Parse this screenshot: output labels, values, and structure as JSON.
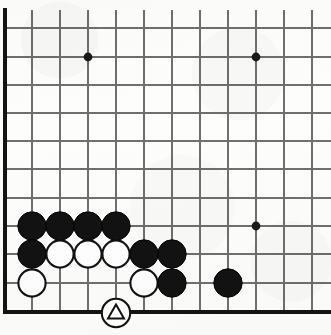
{
  "diagram": {
    "kind": "go-board",
    "board_size": 19,
    "view": {
      "width": 331,
      "height": 335,
      "cell_size": 28,
      "origin_x": 4,
      "origin_y": 0,
      "cropped_edges": [
        "top",
        "right"
      ],
      "visible_columns": 12,
      "visible_rows": 12
    },
    "colors": {
      "background": "#fdfdfc",
      "grid_line": "#6f6f70",
      "border_line": "#141414",
      "black_stone": "#121212",
      "white_stone": "#ffffff",
      "stone_outline": "#111111",
      "star_point": "#1a1a1a",
      "mark": "#111111"
    },
    "geometry": {
      "left_edge_x": 4,
      "bottom_edge_y": 312,
      "vertical_lines_x": [
        4,
        32,
        60,
        88,
        116,
        144,
        172,
        200,
        228,
        256,
        284,
        312
      ],
      "horizontal_lines_y": [
        28,
        57,
        85,
        113,
        141,
        169,
        198,
        226,
        254,
        283,
        312
      ],
      "top_tick_y": 10,
      "stone_radius": 14.2,
      "star_radius": 4.4
    },
    "star_points": [
      {
        "name": "star-point-upper-left",
        "x": 88,
        "y": 57
      },
      {
        "name": "star-point-upper-right",
        "x": 256,
        "y": 57
      },
      {
        "name": "star-point-lower-right",
        "x": 256,
        "y": 226
      }
    ],
    "stones": [
      {
        "id": "b1",
        "color": "black",
        "x": 32,
        "y": 226
      },
      {
        "id": "b2",
        "color": "black",
        "x": 60,
        "y": 226
      },
      {
        "id": "b3",
        "color": "black",
        "x": 88,
        "y": 226
      },
      {
        "id": "b4",
        "color": "black",
        "x": 116,
        "y": 226
      },
      {
        "id": "b5",
        "color": "black",
        "x": 32,
        "y": 254
      },
      {
        "id": "w1",
        "color": "white",
        "x": 60,
        "y": 254
      },
      {
        "id": "w2",
        "color": "white",
        "x": 88,
        "y": 254
      },
      {
        "id": "w3",
        "color": "white",
        "x": 116,
        "y": 254
      },
      {
        "id": "b6",
        "color": "black",
        "x": 144,
        "y": 254
      },
      {
        "id": "b7",
        "color": "black",
        "x": 172,
        "y": 254
      },
      {
        "id": "w4",
        "color": "white",
        "x": 32,
        "y": 283
      },
      {
        "id": "w5",
        "color": "white",
        "x": 144,
        "y": 283
      },
      {
        "id": "b8",
        "color": "black",
        "x": 172,
        "y": 283
      },
      {
        "id": "b9",
        "color": "black",
        "x": 228,
        "y": 283
      }
    ],
    "marked_stone": {
      "id": "wm",
      "color": "white",
      "x": 116,
      "y": 312,
      "mark": "triangle",
      "mark_label": "triangle-marked-white-stone"
    }
  }
}
